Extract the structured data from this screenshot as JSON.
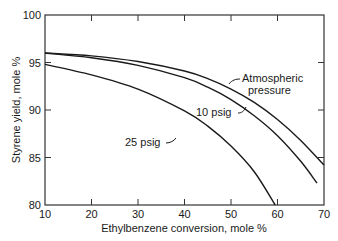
{
  "chart_data": {
    "type": "line",
    "title": "",
    "xlabel": "Ethylbenzene conversion, mole %",
    "ylabel": "Styrene yield, mole %",
    "xlim": [
      10,
      70
    ],
    "ylim": [
      80,
      100
    ],
    "xticks": [
      10,
      20,
      30,
      40,
      50,
      60,
      70
    ],
    "yticks": [
      80,
      85,
      90,
      95,
      100
    ],
    "grid": false,
    "legend": "none (curves labeled directly)",
    "series": [
      {
        "name": "Atmospheric pressure",
        "x": [
          10,
          20,
          30,
          40,
          45,
          50,
          55,
          60,
          65,
          70
        ],
        "y": [
          96.0,
          95.7,
          95.1,
          94.1,
          93.3,
          92.2,
          90.8,
          89.0,
          86.8,
          84.2
        ]
      },
      {
        "name": "10 psig",
        "x": [
          10,
          20,
          30,
          40,
          45,
          50,
          55,
          60,
          65,
          68.5
        ],
        "y": [
          96.0,
          95.5,
          94.7,
          93.4,
          92.4,
          91.1,
          89.4,
          87.3,
          84.6,
          82.3
        ]
      },
      {
        "name": "25 psig",
        "x": [
          10,
          20,
          30,
          40,
          45,
          50,
          55,
          59.5
        ],
        "y": [
          94.8,
          93.7,
          92.2,
          89.9,
          88.3,
          86.2,
          83.5,
          80.0
        ]
      }
    ],
    "annotations": [
      {
        "text": "Atmospheric",
        "text2": "pressure",
        "points_to": "Atmospheric pressure"
      },
      {
        "text": "10 psig",
        "points_to": "10 psig"
      },
      {
        "text": "25 psig",
        "points_to": "25 psig"
      }
    ]
  },
  "labels": {
    "xlabel": "Ethylbenzene conversion, mole %",
    "ylabel": "Styrene yield, mole %",
    "atm_line1": "Atmospheric",
    "atm_line2": "pressure",
    "psig10": "10 psig",
    "psig25": "25 psig"
  }
}
